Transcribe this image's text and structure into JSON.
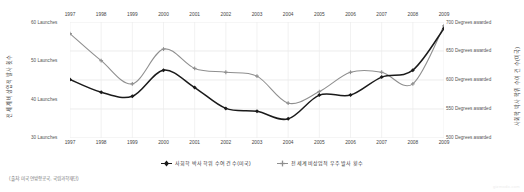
{
  "chart_data": {
    "type": "line",
    "title": "",
    "x": [
      1997,
      1998,
      1999,
      2000,
      2001,
      2002,
      2003,
      2004,
      2005,
      2006,
      2007,
      2008,
      2009
    ],
    "categories": [
      "1997",
      "1998",
      "1999",
      "2000",
      "2001",
      "2002",
      "2003",
      "2004",
      "2005",
      "2006",
      "2007",
      "2008",
      "2009"
    ],
    "grid": true,
    "legend_position": "bottom",
    "series": [
      {
        "name": "사회학 박사 학위 수여 건 수(미국)",
        "axis": "right",
        "color": "#1a1a1a",
        "marker": "diamond",
        "unit": "Degrees awarded",
        "values": [
          601,
          579,
          572,
          617,
          587,
          551,
          546,
          533,
          574,
          574,
          605,
          617,
          689
        ]
      },
      {
        "name": "전 세계 비상업적 우주 발사 횟수",
        "axis": "left",
        "color": "#8f8f8f",
        "marker": "plus",
        "unit": "Launches",
        "values": [
          57,
          50,
          44,
          53,
          48,
          47,
          46,
          39,
          42,
          47,
          47,
          44,
          59
        ]
      }
    ],
    "left_axis": {
      "label": "전 세계 비상업적 발사 횟수",
      "ticks": [
        60,
        50,
        40,
        30
      ],
      "tick_labels": [
        "60 Launches",
        "50 Launches",
        "40 Launches",
        "30 Launches"
      ],
      "ylim": [
        30,
        60
      ]
    },
    "right_axis": {
      "label": "사회학 박사 학위 수여 건 수(미국)",
      "ticks": [
        700,
        650,
        600,
        550,
        500
      ],
      "tick_labels": [
        "700 Degrees awarded",
        "650 Degrees awarded",
        "600 Degrees awarded",
        "550 Degrees awarded",
        "500 Degrees awarded"
      ],
      "ylim": [
        500,
        700
      ]
    },
    "xlabel": "",
    "ylabel": "전 세계 비상업적 발사 횟수"
  },
  "legend": {
    "items": [
      {
        "label": "사회학 박사 학위 수여 건 수(미국)",
        "color": "#1a1a1a",
        "marker": "diamond"
      },
      {
        "label": "전 세계 비상업적 우주 발사 횟수",
        "color": "#8f8f8f",
        "marker": "plus"
      }
    ]
  },
  "footer": {
    "source": "(출처: 미국 연방항공국, 국립과학재단)",
    "watermark": "gizmodo.com"
  }
}
